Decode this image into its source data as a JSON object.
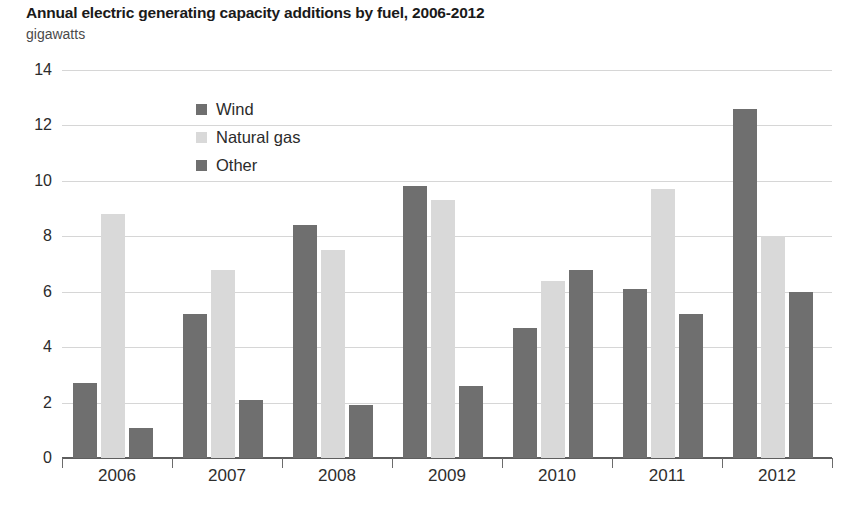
{
  "chart_data": {
    "type": "bar",
    "title": "Annual electric generating capacity additions by fuel, 2006-2012",
    "ylabel": "gigawatts",
    "xlabel": "",
    "categories": [
      "2006",
      "2007",
      "2008",
      "2009",
      "2010",
      "2011",
      "2012"
    ],
    "series": [
      {
        "name": "Wind",
        "color": "#6f6f6f",
        "values": [
          2.7,
          5.2,
          8.4,
          9.8,
          4.7,
          6.1,
          12.6
        ]
      },
      {
        "name": "Natural gas",
        "color": "#d9d9d9",
        "values": [
          8.8,
          6.8,
          7.5,
          9.3,
          6.4,
          9.7,
          8.0
        ]
      },
      {
        "name": "Other",
        "color": "#6f6f6f",
        "values": [
          1.1,
          2.1,
          1.9,
          2.6,
          6.8,
          5.2,
          6.0
        ]
      }
    ],
    "yticks": [
      0,
      2,
      4,
      6,
      8,
      10,
      12,
      14
    ],
    "ylim": [
      0,
      14
    ],
    "grid": true,
    "legend_position": "inside-upper-left"
  },
  "legend": {
    "items": [
      {
        "label": "Wind"
      },
      {
        "label": "Natural gas"
      },
      {
        "label": "Other"
      }
    ]
  }
}
